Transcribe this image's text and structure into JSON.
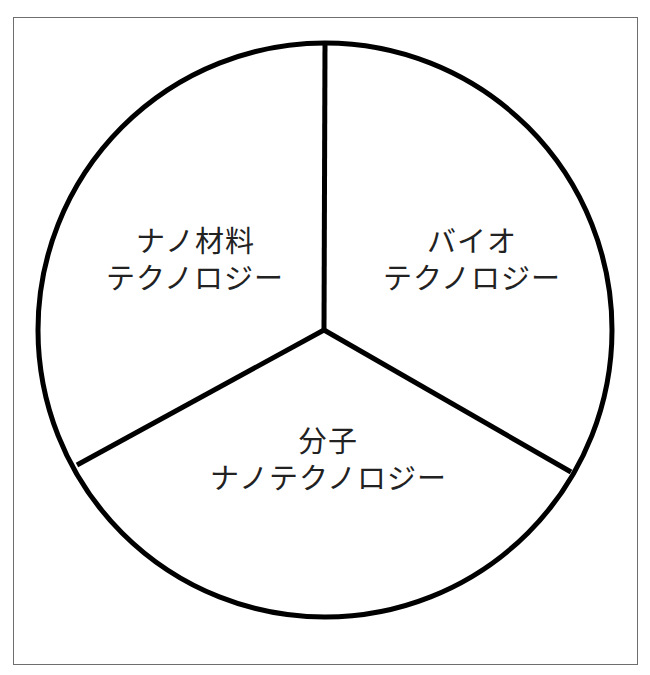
{
  "diagram": {
    "type": "three-sector circle (Venn-like partition)",
    "colors": {
      "stroke": "#000000",
      "frame": "#6e6e6e",
      "text": "#222222",
      "background": "#ffffff"
    },
    "sectors": [
      {
        "id": "nano-materials",
        "line1": "ナノ材料",
        "line2": "テクノロジー"
      },
      {
        "id": "bio",
        "line1": "バイオ",
        "line2": "テクノロジー"
      },
      {
        "id": "molecular",
        "line1": "分子",
        "line2": "ナノテクノロジー"
      }
    ]
  }
}
